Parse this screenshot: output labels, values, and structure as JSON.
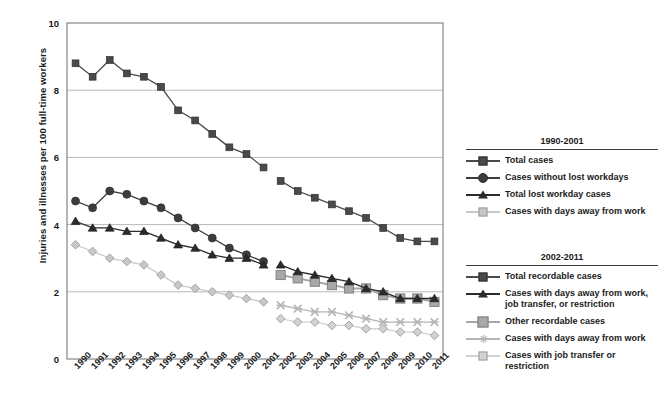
{
  "chart_data": {
    "type": "line",
    "title": "",
    "xlabel": "",
    "ylabel": "Injuries and illnesses per 100 full-time workers",
    "ylim": [
      0,
      10
    ],
    "yticks": [
      0,
      2,
      4,
      6,
      8,
      10
    ],
    "grid": true,
    "legend_position": "right",
    "categories": [
      "1990",
      "1991",
      "1992",
      "1993",
      "1994",
      "1995",
      "1996",
      "1997",
      "1998",
      "1999",
      "2000",
      "2001",
      "2002",
      "2003",
      "2004",
      "2005",
      "2006",
      "2007",
      "2008",
      "2009",
      "2010",
      "2011"
    ],
    "series": [
      {
        "name": "Total cases",
        "period": "1990-2001",
        "marker": "square",
        "color": "#4a4a4a",
        "x": [
          "1990",
          "1991",
          "1992",
          "1993",
          "1994",
          "1995",
          "1996",
          "1997",
          "1998",
          "1999",
          "2000",
          "2001"
        ],
        "values": [
          8.8,
          8.4,
          8.9,
          8.5,
          8.4,
          8.1,
          7.4,
          7.1,
          6.7,
          6.3,
          6.1,
          5.7
        ]
      },
      {
        "name": "Cases without lost workdays",
        "period": "1990-2001",
        "marker": "circle",
        "color": "#3c3c3c",
        "x": [
          "1990",
          "1991",
          "1992",
          "1993",
          "1994",
          "1995",
          "1996",
          "1997",
          "1998",
          "1999",
          "2000",
          "2001"
        ],
        "values": [
          4.7,
          4.5,
          5.0,
          4.9,
          4.7,
          4.5,
          4.2,
          3.9,
          3.6,
          3.3,
          3.1,
          2.9
        ]
      },
      {
        "name": "Total lost workday cases",
        "period": "1990-2001",
        "marker": "triangle",
        "color": "#2b2b2b",
        "x": [
          "1990",
          "1991",
          "1992",
          "1993",
          "1994",
          "1995",
          "1996",
          "1997",
          "1998",
          "1999",
          "2000",
          "2001"
        ],
        "values": [
          4.1,
          3.9,
          3.9,
          3.8,
          3.8,
          3.6,
          3.4,
          3.3,
          3.1,
          3.0,
          3.0,
          2.8
        ]
      },
      {
        "name": "Cases with days away from work",
        "period": "1990-2001",
        "marker": "diamond",
        "color": "#c8c8c8",
        "x": [
          "1990",
          "1991",
          "1992",
          "1993",
          "1994",
          "1995",
          "1996",
          "1997",
          "1998",
          "1999",
          "2000",
          "2001"
        ],
        "values": [
          3.4,
          3.2,
          3.0,
          2.9,
          2.8,
          2.5,
          2.2,
          2.1,
          2.0,
          1.9,
          1.8,
          1.7
        ]
      },
      {
        "name": "Total recordable cases",
        "period": "2002-2011",
        "marker": "square",
        "color": "#4a4a4a",
        "x": [
          "2002",
          "2003",
          "2004",
          "2005",
          "2006",
          "2007",
          "2008",
          "2009",
          "2010",
          "2011"
        ],
        "values": [
          5.3,
          5.0,
          4.8,
          4.6,
          4.4,
          4.2,
          3.9,
          3.6,
          3.5,
          3.5
        ]
      },
      {
        "name": "Cases with days away from work, job transfer, or restriction",
        "period": "2002-2011",
        "marker": "triangle",
        "color": "#2b2b2b",
        "x": [
          "2002",
          "2003",
          "2004",
          "2005",
          "2006",
          "2007",
          "2008",
          "2009",
          "2010",
          "2011"
        ],
        "values": [
          2.8,
          2.6,
          2.5,
          2.4,
          2.3,
          2.1,
          2.0,
          1.8,
          1.8,
          1.8
        ]
      },
      {
        "name": "Other recordable cases",
        "period": "2002-2011",
        "marker": "square-light",
        "color": "#a8a8a8",
        "x": [
          "2002",
          "2003",
          "2004",
          "2005",
          "2006",
          "2007",
          "2008",
          "2009",
          "2010",
          "2011"
        ],
        "values": [
          2.5,
          2.4,
          2.3,
          2.2,
          2.1,
          2.1,
          1.9,
          1.8,
          1.8,
          1.7
        ]
      },
      {
        "name": "Cases with days away from work",
        "period": "2002-2011",
        "marker": "x",
        "color": "#b5b5b5",
        "x": [
          "2002",
          "2003",
          "2004",
          "2005",
          "2006",
          "2007",
          "2008",
          "2009",
          "2010",
          "2011"
        ],
        "values": [
          1.6,
          1.5,
          1.4,
          1.4,
          1.3,
          1.2,
          1.1,
          1.1,
          1.1,
          1.1
        ]
      },
      {
        "name": "Cases with job transfer or restriction",
        "period": "2002-2011",
        "marker": "diamond",
        "color": "#d2d2d2",
        "x": [
          "2002",
          "2003",
          "2004",
          "2005",
          "2006",
          "2007",
          "2008",
          "2009",
          "2010",
          "2011"
        ],
        "values": [
          1.2,
          1.1,
          1.1,
          1.0,
          1.0,
          0.9,
          0.9,
          0.8,
          0.8,
          0.7
        ]
      }
    ]
  },
  "axis": {
    "y_label": "Injuries and illnesses per 100 full-time workers",
    "y_ticks": [
      "0",
      "2",
      "4",
      "6",
      "8",
      "10"
    ],
    "x_ticks": [
      "1990",
      "1991",
      "1992",
      "1993",
      "1994",
      "1995",
      "1996",
      "1997",
      "1998",
      "1999",
      "2000",
      "2001",
      "2002",
      "2003",
      "2004",
      "2005",
      "2006",
      "2007",
      "2008",
      "2009",
      "2010",
      "2011"
    ]
  },
  "legend_a": {
    "title": "1990-2001",
    "items": [
      {
        "label": "Total cases",
        "marker": "square",
        "color": "#4a4a4a"
      },
      {
        "label": "Cases without lost workdays",
        "marker": "circle",
        "color": "#3c3c3c"
      },
      {
        "label": "Total lost workday cases",
        "marker": "triangle",
        "color": "#2b2b2b"
      },
      {
        "label": "Cases with days away from work",
        "marker": "diamond",
        "color": "#c8c8c8"
      }
    ]
  },
  "legend_b": {
    "title": "2002-2011",
    "items": [
      {
        "label": "Total recordable cases",
        "marker": "square",
        "color": "#4a4a4a"
      },
      {
        "label": "Cases with days away from work, job transfer, or restriction",
        "marker": "triangle",
        "color": "#2b2b2b"
      },
      {
        "label": "Other recordable cases",
        "marker": "square-light",
        "color": "#a8a8a8"
      },
      {
        "label": "Cases with days away from work",
        "marker": "x",
        "color": "#b5b5b5"
      },
      {
        "label": "Cases with job transfer or restriction",
        "marker": "diamond",
        "color": "#d2d2d2"
      }
    ]
  }
}
